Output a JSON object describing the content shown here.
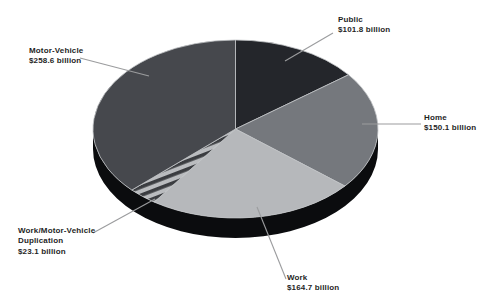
{
  "chart_data": {
    "type": "pie",
    "style": "3d-exploded-depth",
    "direction": "clockwise",
    "start_angle_deg": 0,
    "unit": "billion",
    "slices": [
      {
        "label": "Public",
        "value": 101.8,
        "display": "$101.8 billion",
        "color": "#24262b"
      },
      {
        "label": "Home",
        "value": 150.1,
        "display": "$150.1 billion",
        "color": "#75787d"
      },
      {
        "label": "Work",
        "value": 164.7,
        "display": "$164.7 billion",
        "color": "#b6b8bb"
      },
      {
        "label": "Work/Motor-Vehicle Duplication",
        "value": 23.1,
        "display": "$23.1 billion",
        "color": "#babcbf",
        "pattern": "diagonal-stripes",
        "stripe_color": "#3b3d41",
        "stripe_angle_deg": -21,
        "stripe_period": 7.7,
        "stripe_width": 3.6
      },
      {
        "label": "Motor-Vehicle",
        "value": 258.6,
        "display": "$258.6 billion",
        "color": "#46484d"
      }
    ],
    "layout": {
      "cx": 235.5,
      "cy": 129,
      "rx": 142.5,
      "ry": 89,
      "depth": 20,
      "rim_color": "#0b0c0e",
      "separator_color": "#c2c4c6",
      "leader_color": "#9b9c9e",
      "text_color": "#1f1f1f",
      "background": "#ffffff"
    },
    "labels": [
      {
        "slice": "Public",
        "lines": [
          "Public",
          "$101.8 billion"
        ],
        "x": 338,
        "y": 15,
        "leader": [
          333,
          33,
          285,
          61
        ]
      },
      {
        "slice": "Home",
        "lines": [
          "Home",
          "$150.1 billion"
        ],
        "x": 424,
        "y": 113,
        "leader": [
          421,
          124,
          362,
          124
        ]
      },
      {
        "slice": "Motor-Vehicle",
        "lines": [
          "Motor-Vehicle",
          "$258.6 billion"
        ],
        "x": 29,
        "y": 46,
        "leader": [
          80,
          58,
          149,
          76
        ]
      },
      {
        "slice": "Work/Motor-Vehicle Duplication",
        "lines": [
          "Work/Motor-Vehicle",
          "Duplication",
          "$23.1 billion"
        ],
        "x": 18,
        "y": 226,
        "leader": [
          93,
          233,
          155,
          199
        ]
      },
      {
        "slice": "Work",
        "lines": [
          "Work",
          "$164.7 billion"
        ],
        "x": 287,
        "y": 273,
        "leader": [
          286,
          279,
          257,
          207
        ]
      }
    ]
  }
}
